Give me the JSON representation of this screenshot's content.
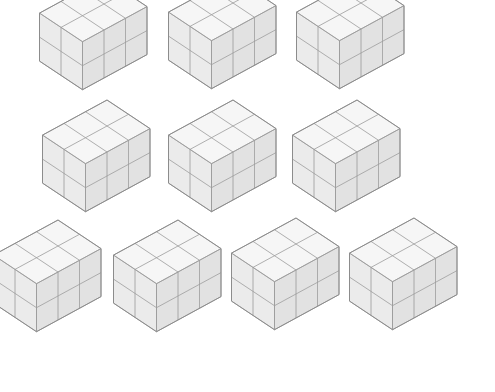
{
  "figure": {
    "rows": [
      3,
      3,
      4
    ],
    "block": {
      "shape": "rectangular cuboid of unit cubes",
      "cubes_along_left_axis": 3,
      "cubes_along_right_axis": 2,
      "layers": 2,
      "cube_count": 12
    },
    "blocks": [
      {
        "id": "block-1",
        "row": 1,
        "col": 1
      },
      {
        "id": "block-2",
        "row": 1,
        "col": 2
      },
      {
        "id": "block-3",
        "row": 1,
        "col": 3
      },
      {
        "id": "block-4",
        "row": 2,
        "col": 1
      },
      {
        "id": "block-5",
        "row": 2,
        "col": 2
      },
      {
        "id": "block-6",
        "row": 2,
        "col": 3
      },
      {
        "id": "block-7",
        "row": 3,
        "col": 1
      },
      {
        "id": "block-8",
        "row": 3,
        "col": 2
      },
      {
        "id": "block-9",
        "row": 3,
        "col": 3
      },
      {
        "id": "block-10",
        "row": 3,
        "col": 4
      }
    ],
    "colors": {
      "top": "#f6f6f6",
      "left": "#e2e2e2",
      "right": "#ebebeb",
      "edge": "#9a9a9a",
      "background": "#ffffff"
    }
  }
}
